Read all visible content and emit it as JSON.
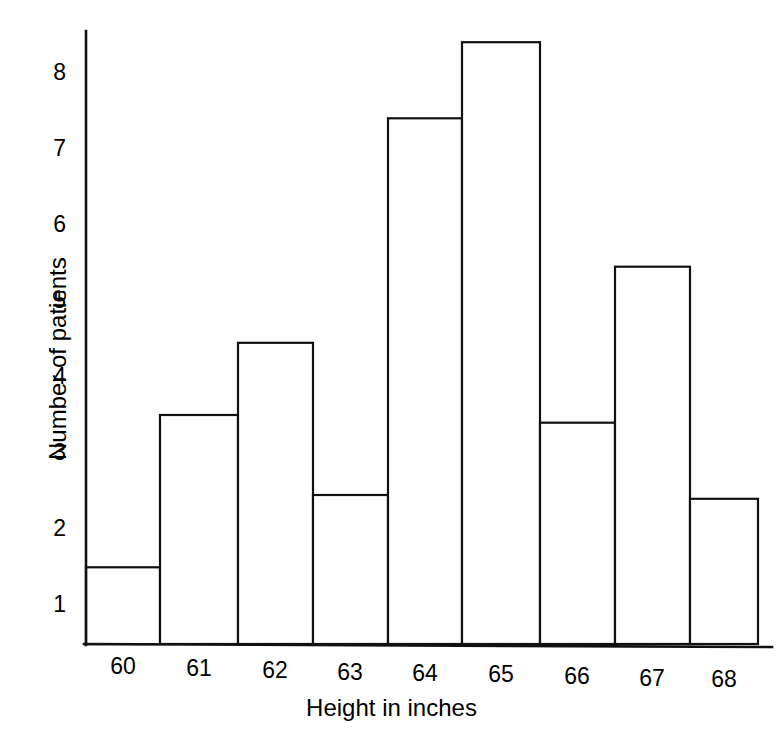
{
  "chart_data": {
    "type": "bar",
    "title": "",
    "subtitle": "",
    "xlabel": "Height in inches",
    "ylabel": "Number of patients",
    "categories": [
      "60",
      "61",
      "62",
      "63",
      "64",
      "65",
      "66",
      "67",
      "68"
    ],
    "values": [
      1.5,
      3.5,
      4.45,
      2.45,
      7.4,
      8.4,
      3.4,
      5.45,
      2.4
    ],
    "xtick_labels": [
      "60",
      "61",
      "62",
      "63",
      "64",
      "65",
      "66",
      "67",
      "68"
    ],
    "ytick_labels": [
      "1",
      "2",
      "3",
      "4",
      "5",
      "6",
      "7",
      "8"
    ],
    "ytick_values": [
      1,
      2,
      3,
      4,
      5,
      6,
      7,
      8
    ],
    "ylim": [
      0.49,
      8.9
    ],
    "grid": false,
    "legend": false,
    "legend_position": "none",
    "bar_style": "adjacent-histogram-outline",
    "bar_fill": "#ffffff",
    "bar_edge_color": "#111111",
    "axis_color": "#111111",
    "background": "#ffffff"
  },
  "axes": {
    "y_title": "Number of patients",
    "x_title": "Height in inches"
  },
  "ticks": {
    "y": [
      {
        "label": "8",
        "value": 8
      },
      {
        "label": "7",
        "value": 7
      },
      {
        "label": "6",
        "value": 6
      },
      {
        "label": "5",
        "value": 5
      },
      {
        "label": "4",
        "value": 4
      },
      {
        "label": "3",
        "value": 3
      },
      {
        "label": "2",
        "value": 2
      },
      {
        "label": "1",
        "value": 1
      }
    ],
    "x": [
      {
        "label": "60"
      },
      {
        "label": "61"
      },
      {
        "label": "62"
      },
      {
        "label": "63"
      },
      {
        "label": "64"
      },
      {
        "label": "65"
      },
      {
        "label": "66"
      },
      {
        "label": "67"
      },
      {
        "label": "68"
      }
    ]
  }
}
